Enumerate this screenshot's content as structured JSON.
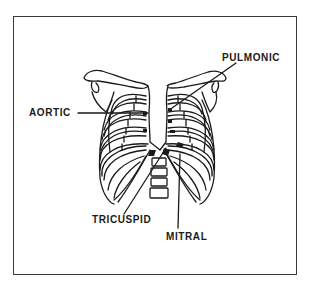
{
  "diagram": {
    "title": "",
    "labels": {
      "aortic": "AORTIC",
      "pulmonic": "PULMONIC",
      "tricuspid": "TRICUSPID",
      "mitral": "MITRAL"
    },
    "colors": {
      "line": "#1a1a1a",
      "background": "#ffffff",
      "frame": "#3a3a3a"
    }
  }
}
